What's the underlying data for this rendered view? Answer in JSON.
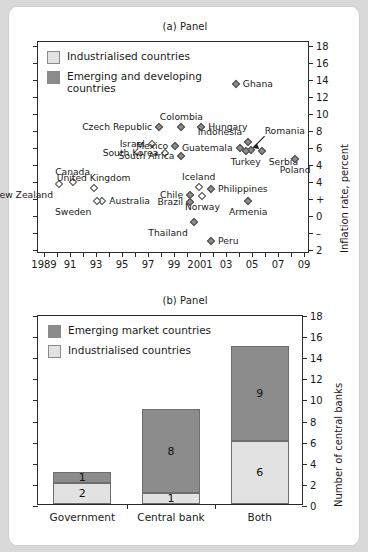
{
  "figure": {
    "background_color": "#d9d9d9",
    "card_color": "#ffffff"
  },
  "colors": {
    "industrialised": "#e2e2e2",
    "emerging": "#8c8c8c",
    "axis": "#2b2b2b",
    "marker_edge": "#4a4a4a"
  },
  "panel_a": {
    "title": "(a) Panel",
    "legend": [
      {
        "key": "industrialised",
        "label": "Industrialised countries",
        "swatch": "#e2e2e2"
      },
      {
        "key": "emerging",
        "label": "Emerging and developing\ncountries",
        "swatch": "#8c8c8c"
      }
    ],
    "y_axis_title": "Inflation rate, percent",
    "y_ticks": [
      "18",
      "16",
      "14",
      "12",
      "10",
      "8",
      "6",
      "4",
      "4",
      "+",
      "0",
      "–",
      "2"
    ],
    "x_ticks": [
      "1989",
      "91",
      "93",
      "95",
      "97",
      "99",
      "2001",
      "03",
      "05",
      "07",
      "09"
    ],
    "annotation_romania": "Romania"
  },
  "panel_b": {
    "title": "(b) Panel",
    "legend": [
      {
        "key": "emerging",
        "label": "Emerging market countries",
        "swatch": "#8c8c8c"
      },
      {
        "key": "industrialised",
        "label": "Industrialised countries",
        "swatch": "#e2e2e2"
      }
    ],
    "y_axis_title": "Number of central banks",
    "y_ticks": [
      "18",
      "16",
      "14",
      "12",
      "10",
      "8",
      "6",
      "4",
      "2",
      "0"
    ]
  },
  "chart_data": [
    {
      "type": "scatter",
      "title": "(a) Panel",
      "xlabel": "",
      "ylabel": "Inflation rate, percent",
      "xlim": [
        1988,
        2010
      ],
      "ylim": [
        -2,
        18
      ],
      "grid": false,
      "legend_position": "top-left",
      "legend": [
        "Industrialised countries",
        "Emerging and developing countries"
      ],
      "annotations": [
        {
          "text": "Romania",
          "points_to": "Romania marker",
          "arrow": true
        }
      ],
      "points": [
        {
          "name": "Ghana",
          "x": 2004.0,
          "y": 14.0,
          "group": "emerging",
          "label_side": "right"
        },
        {
          "name": "Colombia",
          "x": 1999.6,
          "y": 10.0,
          "group": "emerging",
          "label_side": "above"
        },
        {
          "name": "Czech Republic",
          "x": 1997.8,
          "y": 10.0,
          "group": "emerging",
          "label_side": "left"
        },
        {
          "name": "Hungary",
          "x": 2001.2,
          "y": 10.0,
          "group": "emerging",
          "label_side": "right"
        },
        {
          "name": "Indonesia",
          "x": 2005.0,
          "y": 8.6,
          "group": "emerging",
          "label_side": "above-left"
        },
        {
          "name": "Israel",
          "x": 1997.2,
          "y": 8.4,
          "group": "industrialised",
          "label_side": "left"
        },
        {
          "name": "Mexico",
          "x": 1999.1,
          "y": 8.2,
          "group": "emerging",
          "label_side": "left"
        },
        {
          "name": "Guatemala",
          "x": 2004.3,
          "y": 8.0,
          "group": "emerging",
          "label_side": "left"
        },
        {
          "name": "Romania",
          "x": 2005.2,
          "y": 7.8,
          "group": "emerging",
          "label_side": "arrow"
        },
        {
          "name": "Turkey",
          "x": 2004.8,
          "y": 7.7,
          "group": "emerging",
          "label_side": "below"
        },
        {
          "name": "Serbia",
          "x": 2006.1,
          "y": 7.7,
          "group": "emerging",
          "label_side": "below-right"
        },
        {
          "name": "South Korea",
          "x": 1998.3,
          "y": 7.5,
          "group": "industrialised",
          "label_side": "left"
        },
        {
          "name": "South Africa",
          "x": 1999.6,
          "y": 7.2,
          "group": "emerging",
          "label_side": "left"
        },
        {
          "name": "Poland",
          "x": 2008.8,
          "y": 7.0,
          "group": "emerging",
          "label_side": "below"
        },
        {
          "name": "Canada",
          "x": 1990.8,
          "y": 4.8,
          "group": "industrialised",
          "label_side": "above"
        },
        {
          "name": "New Zealand",
          "x": 1989.7,
          "y": 4.6,
          "group": "industrialised",
          "label_side": "below-left"
        },
        {
          "name": "United Kingdom",
          "x": 1992.5,
          "y": 4.2,
          "group": "industrialised",
          "label_side": "above"
        },
        {
          "name": "Iceland",
          "x": 2001.0,
          "y": 4.3,
          "group": "industrialised",
          "label_side": "above"
        },
        {
          "name": "Philippines",
          "x": 2002.0,
          "y": 4.1,
          "group": "emerging",
          "label_side": "right"
        },
        {
          "name": "Chile",
          "x": 2000.3,
          "y": 3.6,
          "group": "emerging",
          "label_side": "left"
        },
        {
          "name": "Norway",
          "x": 2001.3,
          "y": 3.5,
          "group": "industrialised",
          "label_side": "below"
        },
        {
          "name": "Australia",
          "x": 1993.2,
          "y": 3.0,
          "group": "industrialised",
          "label_side": "right"
        },
        {
          "name": "Sweden",
          "x": 1992.8,
          "y": 3.0,
          "group": "industrialised",
          "label_side": "below-left"
        },
        {
          "name": "Brazil",
          "x": 2000.3,
          "y": 2.9,
          "group": "emerging",
          "label_side": "left"
        },
        {
          "name": "Armenia",
          "x": 2005.0,
          "y": 3.0,
          "group": "emerging",
          "label_side": "below"
        },
        {
          "name": "Thailand",
          "x": 2000.6,
          "y": 1.0,
          "group": "emerging",
          "label_side": "below-left"
        },
        {
          "name": "Peru",
          "x": 2002.0,
          "y": -0.8,
          "group": "emerging",
          "label_side": "right"
        }
      ]
    },
    {
      "type": "bar",
      "title": "(b) Panel",
      "xlabel": "",
      "ylabel": "Number of central banks",
      "ylim": [
        0,
        18
      ],
      "grid": false,
      "stacked": true,
      "legend_position": "top-left",
      "categories": [
        "Government",
        "Central bank",
        "Both"
      ],
      "series": [
        {
          "name": "Industrialised countries",
          "color": "#e2e2e2",
          "values": [
            2,
            1,
            6
          ]
        },
        {
          "name": "Emerging market countries",
          "color": "#8c8c8c",
          "values": [
            1,
            8,
            9
          ]
        }
      ],
      "totals": [
        3,
        9,
        15
      ]
    }
  ]
}
